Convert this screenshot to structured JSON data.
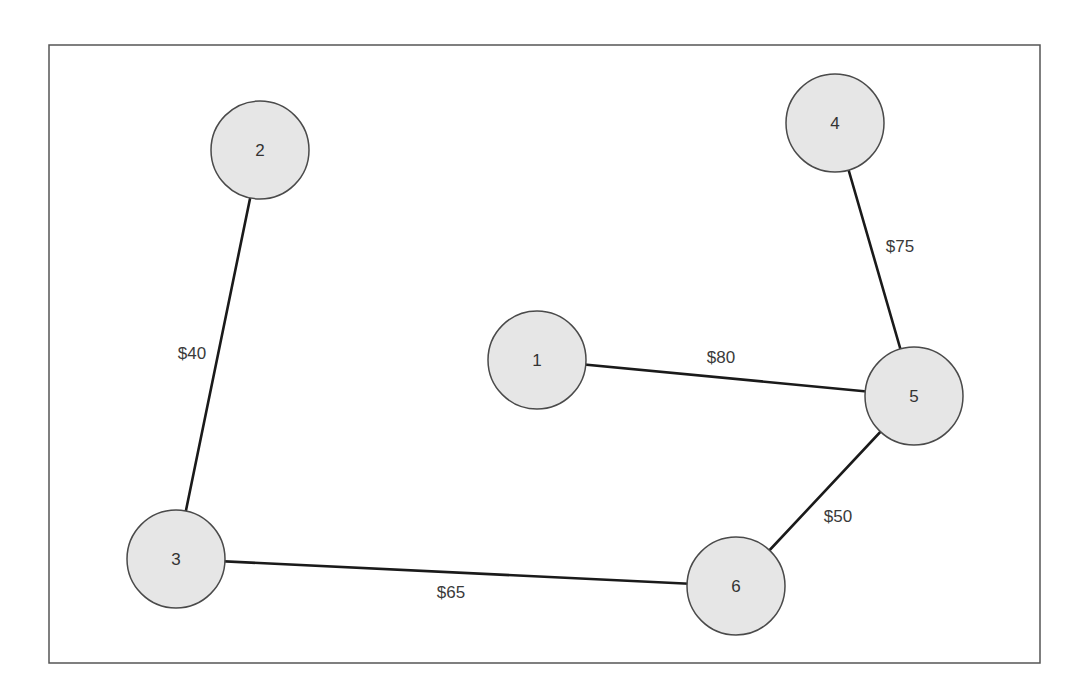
{
  "diagram": {
    "type": "weighted-graph",
    "frame": {
      "x": 49,
      "y": 45,
      "width": 991,
      "height": 618
    },
    "colors": {
      "node_fill": "#e6e6e6",
      "node_stroke": "#4a4a4a",
      "edge_stroke": "#1a1a1a",
      "text": "#333333",
      "frame_stroke": "#555555"
    },
    "nodes": [
      {
        "id": "1",
        "label": "1",
        "cx": 537,
        "cy": 360,
        "r": 49
      },
      {
        "id": "2",
        "label": "2",
        "cx": 260,
        "cy": 150,
        "r": 49
      },
      {
        "id": "3",
        "label": "3",
        "cx": 176,
        "cy": 559,
        "r": 49
      },
      {
        "id": "4",
        "label": "4",
        "cx": 835,
        "cy": 123,
        "r": 49
      },
      {
        "id": "5",
        "label": "5",
        "cx": 914,
        "cy": 396,
        "r": 49
      },
      {
        "id": "6",
        "label": "6",
        "cx": 736,
        "cy": 586,
        "r": 49
      }
    ],
    "edges": [
      {
        "from": "2",
        "to": "3",
        "label": "$40",
        "lx": 192,
        "ly": 353
      },
      {
        "from": "1",
        "to": "5",
        "label": "$80",
        "lx": 721,
        "ly": 357
      },
      {
        "from": "4",
        "to": "5",
        "label": "$75",
        "lx": 900,
        "ly": 246
      },
      {
        "from": "5",
        "to": "6",
        "label": "$50",
        "lx": 838,
        "ly": 516
      },
      {
        "from": "3",
        "to": "6",
        "label": "$65",
        "lx": 451,
        "ly": 592
      }
    ]
  }
}
